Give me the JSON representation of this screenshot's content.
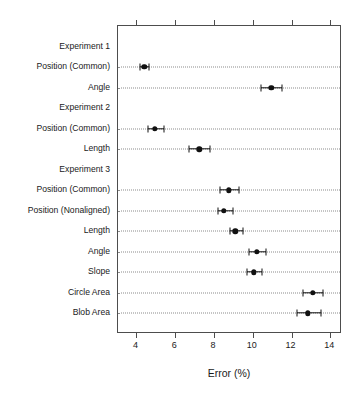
{
  "chart_data": {
    "type": "scatter",
    "title": "",
    "xlabel": "Error (%)",
    "ylabel": "",
    "xlim": [
      3.05,
      14.6
    ],
    "xticks": [
      4,
      6,
      8,
      10,
      12,
      14
    ],
    "xtick_labels": [
      "4",
      "6",
      "8",
      "10",
      "12",
      "14"
    ],
    "grid": "horizontal-dotted",
    "legend": "none",
    "orientation": "horizontal",
    "error_bars": true,
    "rows": [
      {
        "label": "Experiment 1",
        "type": "group",
        "value": null,
        "low": null,
        "high": null
      },
      {
        "label": "Position (Common)",
        "type": "point",
        "value": 4.4,
        "low": 4.2,
        "high": 4.65
      },
      {
        "label": "Angle",
        "type": "point",
        "value": 10.95,
        "low": 10.4,
        "high": 11.5
      },
      {
        "label": "Experiment 2",
        "type": "group",
        "value": null,
        "low": null,
        "high": null
      },
      {
        "label": "Position (Common)",
        "type": "point",
        "value": 4.95,
        "low": 4.6,
        "high": 5.4
      },
      {
        "label": "Length",
        "type": "point",
        "value": 7.25,
        "low": 6.7,
        "high": 7.8
      },
      {
        "label": "Experiment 3",
        "type": "group",
        "value": null,
        "low": null,
        "high": null
      },
      {
        "label": "Position (Common)",
        "type": "point",
        "value": 8.75,
        "low": 8.3,
        "high": 9.3
      },
      {
        "label": "Position (Nonaligned)",
        "type": "point",
        "value": 8.5,
        "low": 8.2,
        "high": 9.0
      },
      {
        "label": "Length",
        "type": "point",
        "value": 9.1,
        "low": 8.85,
        "high": 9.5
      },
      {
        "label": "Angle",
        "type": "point",
        "value": 10.2,
        "low": 9.8,
        "high": 10.7
      },
      {
        "label": "Slope",
        "type": "point",
        "value": 10.05,
        "low": 9.7,
        "high": 10.45
      },
      {
        "label": "Circle Area",
        "type": "point",
        "value": 13.1,
        "low": 12.6,
        "high": 13.6
      },
      {
        "label": "Blob Area",
        "type": "point",
        "value": 12.85,
        "low": 12.3,
        "high": 13.5
      }
    ]
  },
  "colors": {
    "marker": "#111111",
    "axis": "#4d4d4d",
    "grid": "#8c8c8c",
    "text": "#1a1a1a",
    "background": "#ffffff"
  }
}
